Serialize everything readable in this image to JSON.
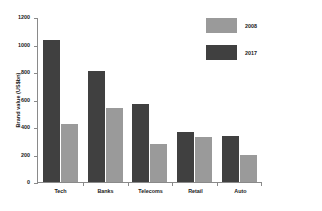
{
  "chart_data": {
    "type": "bar",
    "title": "",
    "xlabel": "",
    "ylabel": "Brand value (US$bn)",
    "ylim": [
      0,
      1200
    ],
    "yticks": [
      0,
      200,
      400,
      600,
      800,
      1000,
      1200
    ],
    "ytick_labels": [
      "0",
      "200",
      "400",
      "600",
      "800",
      "1000",
      "1200"
    ],
    "grid": false,
    "legend_position": "top-right",
    "categories": [
      "Tech",
      "Banks",
      "Telecoms",
      "Retail",
      "Auto"
    ],
    "series": [
      {
        "name": "2017",
        "color": "#404040",
        "values": [
          1030,
          810,
          565,
          365,
          335
        ]
      },
      {
        "name": "2008",
        "color": "#9a9a9a",
        "values": [
          420,
          535,
          275,
          330,
          200
        ]
      }
    ],
    "legend_order": [
      "2008",
      "2017"
    ],
    "legend_colors": [
      "#9a9a9a",
      "#404040"
    ]
  }
}
